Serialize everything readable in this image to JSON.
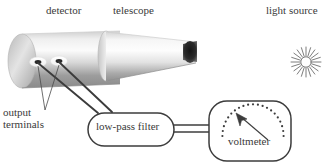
{
  "figure": {
    "background_color": "#ffffff",
    "line_color": "#3a3a3a",
    "labels": {
      "detector": "detector",
      "telescope": "telescope",
      "light_source": "light source",
      "output_terminals_line1": "output",
      "output_terminals_line2": "terminals",
      "low_pass_filter": "low-pass filter",
      "voltmeter": "voltmeter"
    },
    "caption": "",
    "components": [
      {
        "name": "detector",
        "icon": "cylinder-icon",
        "shape": "shaded-cylinder",
        "label": "detector",
        "fill_light": "#f2f2f2",
        "fill_dark": "#8d8d8d"
      },
      {
        "name": "telescope",
        "icon": "cone-icon",
        "shape": "tapered-cone-with-dark-aperture",
        "label": "telescope",
        "fill_light": "#fbfbfb",
        "fill_dark": "#8a8a8a",
        "aperture_color": "#2e2e2e"
      },
      {
        "name": "light-source",
        "icon": "sunburst-icon",
        "shape": "radiating-starburst",
        "label": "light source",
        "ray_count": 20,
        "color": "#707070"
      },
      {
        "name": "output-terminals",
        "icon": "terminal-icon",
        "shape": "two-white-oval-ports",
        "label": "output terminals",
        "count": 2
      },
      {
        "name": "low-pass-filter",
        "icon": "rounded-box-icon",
        "shape": "rounded-rectangle",
        "label": "low-pass filter"
      },
      {
        "name": "voltmeter",
        "icon": "gauge-icon",
        "shape": "rounded-square-with-dotted-arc-and-needle",
        "label": "voltmeter",
        "dot_count": 24,
        "needle_direction": "up-left"
      }
    ],
    "connections": [
      {
        "from": "output-terminal-1",
        "to": "low-pass-filter",
        "style": "single-line"
      },
      {
        "from": "output-terminal-2",
        "to": "low-pass-filter",
        "style": "single-line"
      },
      {
        "from": "low-pass-filter",
        "to": "voltmeter",
        "style": "double-line"
      },
      {
        "from": "output-label",
        "to": "output-terminal-1",
        "style": "leader-line"
      },
      {
        "from": "output-label",
        "to": "output-terminal-2",
        "style": "leader-line"
      }
    ]
  }
}
